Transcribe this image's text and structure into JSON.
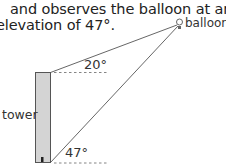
{
  "text": {
    "line1": "and observes the balloon at an",
    "line2": "elevation of 47°."
  },
  "diagram": {
    "balloon_label": "balloon",
    "tower_label": "tower",
    "angle_top": "20°",
    "angle_bottom": "47°"
  },
  "colors": {
    "tower_fill": "#d4d4d4",
    "line": "#555555",
    "text": "#222222"
  }
}
